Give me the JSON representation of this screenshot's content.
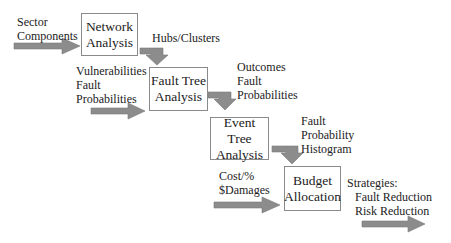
{
  "diagram": {
    "colors": {
      "arrow": "#8c8c8c",
      "arrow_stroke": "#7a7a7a",
      "box_border": "#8a8a8a",
      "text": "#222222"
    },
    "boxes": [
      {
        "id": "network",
        "line1": "Network",
        "line2": "Analysis"
      },
      {
        "id": "fault_tree",
        "line1": "Fault Tree",
        "line2": "Analysis"
      },
      {
        "id": "event_tree",
        "line1": "Event Tree",
        "line2": "Analysis"
      },
      {
        "id": "budget",
        "line1": "Budget",
        "line2": "Allocation"
      }
    ],
    "labels": {
      "sector": [
        "Sector",
        "Components"
      ],
      "hubs": "Hubs/Clusters",
      "vulnerabilities": [
        "Vulnerabilities",
        "Fault",
        "Probabilities"
      ],
      "outcomes": [
        "Outcomes",
        "Fault",
        "Probabilities"
      ],
      "histogram": [
        "Fault",
        "Probability",
        "Histogram"
      ],
      "cost": [
        "Cost/%",
        "$Damages"
      ],
      "strategies": [
        "Strategies:",
        "Fault Reduction",
        "Risk Reduction"
      ]
    }
  }
}
